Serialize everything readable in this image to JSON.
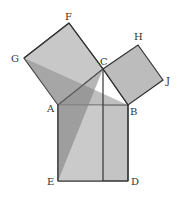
{
  "diagram": {
    "colors": {
      "light_fill": "#c8c8c8",
      "mid_fill": "#a8a8a8",
      "dark_fill": "#8a8a8a",
      "stroke": "#333333",
      "background": "#ffffff"
    },
    "points": {
      "A": {
        "label": "A",
        "x": 58,
        "y": 105
      },
      "B": {
        "label": "B",
        "x": 128,
        "y": 105
      },
      "C": {
        "label": "C",
        "x": 103,
        "y": 69
      },
      "D": {
        "label": "D",
        "x": 128,
        "y": 181
      },
      "E": {
        "label": "E",
        "x": 58,
        "y": 181
      },
      "F": {
        "label": "F",
        "x": 69,
        "y": 23
      },
      "G": {
        "label": "G",
        "x": 24,
        "y": 58
      },
      "H": {
        "label": "H",
        "x": 138,
        "y": 45
      },
      "J": {
        "label": "J",
        "x": 163,
        "y": 80
      }
    },
    "labels": {
      "A": "A",
      "B": "B",
      "C": "C",
      "D": "D",
      "E": "E",
      "F": "F",
      "G": "G",
      "H": "H",
      "J": "J"
    },
    "shapes": [
      {
        "name": "square-ACFG",
        "vertices": [
          "A",
          "C",
          "F",
          "G"
        ]
      },
      {
        "name": "square-BCHJ",
        "vertices": [
          "B",
          "C",
          "H",
          "J"
        ]
      },
      {
        "name": "square-ABDE",
        "vertices": [
          "A",
          "B",
          "D",
          "E"
        ]
      },
      {
        "name": "triangle-GAB",
        "vertices": [
          "G",
          "A",
          "B"
        ]
      },
      {
        "name": "triangle-CAE",
        "vertices": [
          "C",
          "A",
          "E"
        ]
      }
    ]
  }
}
